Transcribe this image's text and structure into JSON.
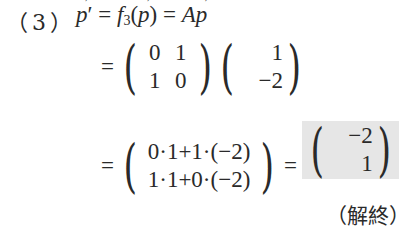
{
  "problem": {
    "label": "（3）",
    "line1": {
      "lhs": "p",
      "prime": "′",
      "eq1": "=",
      "func": "f",
      "func_sub": "3",
      "open": "(",
      "arg": "p",
      "close": ")",
      "eq2": "=",
      "matrix_name": "A",
      "vec": "p"
    },
    "line2": {
      "eq": "=",
      "matrix_A": [
        [
          "0",
          "1"
        ],
        [
          "1",
          "0"
        ]
      ],
      "vector_p": [
        "1",
        "−2"
      ]
    },
    "line3": {
      "eq": "=",
      "expansion": [
        "0·1+1·(−2)",
        "1·1+0·(−2)"
      ],
      "eq2": "=",
      "result": [
        "−2",
        "1"
      ],
      "result_highlight_color": "#e6e6e6"
    },
    "end_mark": "（解終）"
  }
}
